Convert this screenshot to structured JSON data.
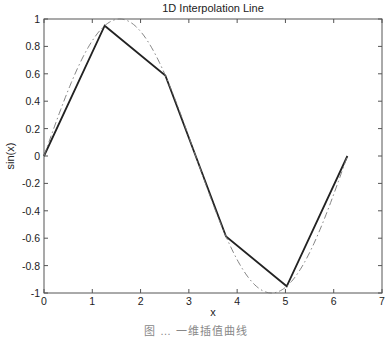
{
  "chart_data": {
    "type": "line",
    "title": "1D Interpolation Line",
    "xlabel": "x",
    "ylabel": "sin(x)",
    "xlim": [
      0,
      7
    ],
    "ylim": [
      -1,
      1
    ],
    "xticks": [
      0,
      1,
      2,
      3,
      4,
      5,
      6,
      7
    ],
    "yticks": [
      -1,
      -0.8,
      -0.6,
      -0.4,
      -0.2,
      0,
      0.2,
      0.4,
      0.6,
      0.8,
      1
    ],
    "grid": false,
    "legend": null,
    "series": [
      {
        "name": "linear interpolation",
        "style": "solid",
        "color": "#222222",
        "x": [
          0,
          1.2566,
          2.5133,
          3.7699,
          5.0265,
          6.2832
        ],
        "y": [
          0,
          0.9511,
          0.5878,
          -0.5878,
          -0.9511,
          0
        ]
      },
      {
        "name": "sin(x)",
        "style": "dash-dot",
        "color": "#777777",
        "function": "sin",
        "x_range": [
          0,
          6.2832
        ]
      }
    ]
  },
  "caption": "图 … 一维插值曲线"
}
